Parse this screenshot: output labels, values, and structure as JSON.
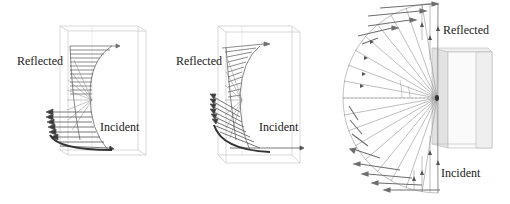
{
  "figure": {
    "panels": [
      {
        "id": "panel-1",
        "labels": {
          "reflected": "Reflected",
          "incident": "Incident"
        }
      },
      {
        "id": "panel-2",
        "labels": {
          "reflected": "Reflected",
          "incident": "Incident"
        }
      },
      {
        "id": "panel-3",
        "labels": {
          "reflected": "Reflected",
          "incident": "Incident"
        }
      }
    ],
    "colors": {
      "background": "#ffffff",
      "box_edge": "#c8c8c8",
      "box_face": "#e6e6e6",
      "arrow": "#6e6e6e",
      "arrow_dark": "#3a3a3a",
      "ray": "#8a8a8a",
      "label_text": "#222222"
    }
  }
}
